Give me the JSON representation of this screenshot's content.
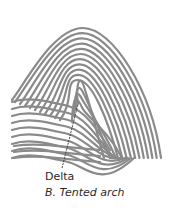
{
  "diagram": {
    "pattern_type": "Tented arch",
    "labels": {
      "delta": "Delta",
      "caption": "B. Tented arch"
    },
    "colors": {
      "ridge": "#8a8a8a",
      "pointer": "#333333",
      "text": "#2a2a2a"
    }
  }
}
